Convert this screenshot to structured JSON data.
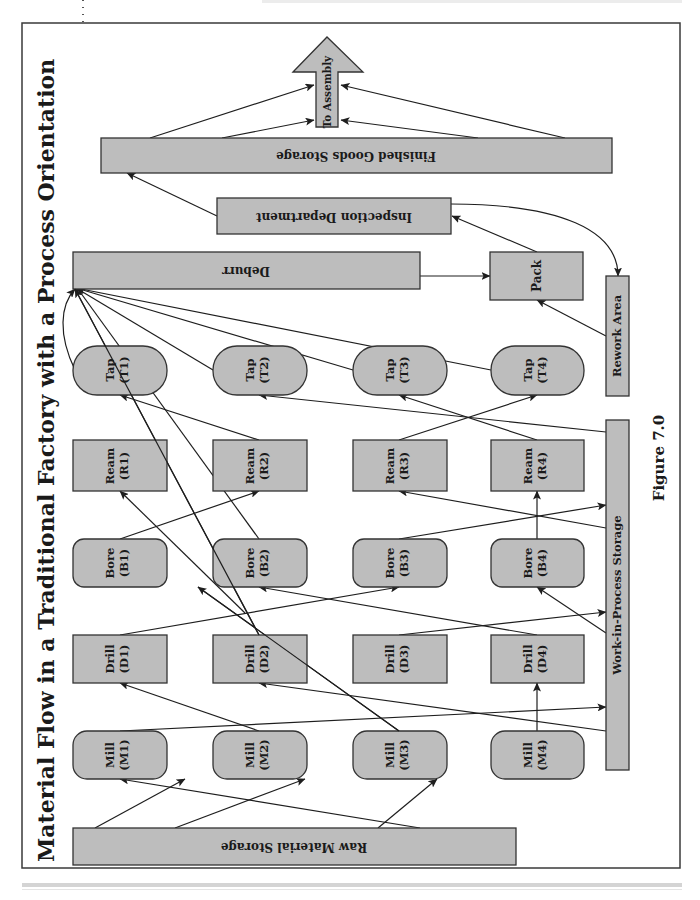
{
  "title": "Material Flow in a Traditional Factory with a Process Orientation",
  "figure_label": "Figure 7.0",
  "colors": {
    "node_fill": "#bdbdbd",
    "node_stroke": "#333333",
    "edge": "#1e1e1e",
    "background": "#ffffff"
  },
  "storage": {
    "raw_material": "Raw Material Storage",
    "work_in_process": "Work-in-Process Storage",
    "finished_goods": "Finished Goods Storage",
    "to_assembly": "To Assembly"
  },
  "departments": {
    "deburr": "Deburr",
    "pack": "Pack",
    "inspection": "Inspection Department",
    "rework": "Rework Area"
  },
  "machines": {
    "mill": [
      {
        "name": "Mill",
        "id": "(M1)"
      },
      {
        "name": "Mill",
        "id": "(M2)"
      },
      {
        "name": "Mill",
        "id": "(M3)"
      },
      {
        "name": "Mill",
        "id": "(M4)"
      }
    ],
    "drill": [
      {
        "name": "Drill",
        "id": "(D1)"
      },
      {
        "name": "Drill",
        "id": "(D2)"
      },
      {
        "name": "Drill",
        "id": "(D3)"
      },
      {
        "name": "Drill",
        "id": "(D4)"
      }
    ],
    "bore": [
      {
        "name": "Bore",
        "id": "(B1)"
      },
      {
        "name": "Bore",
        "id": "(B2)"
      },
      {
        "name": "Bore",
        "id": "(B3)"
      },
      {
        "name": "Bore",
        "id": "(B4)"
      }
    ],
    "ream": [
      {
        "name": "Ream",
        "id": "(R1)"
      },
      {
        "name": "Ream",
        "id": "(R2)"
      },
      {
        "name": "Ream",
        "id": "(R3)"
      },
      {
        "name": "Ream",
        "id": "(R4)"
      }
    ],
    "tap": [
      {
        "name": "Tap",
        "id": "(T1)"
      },
      {
        "name": "Tap",
        "id": "(T2)"
      },
      {
        "name": "Tap",
        "id": "(T3)"
      },
      {
        "name": "Tap",
        "id": "(T4)"
      }
    ]
  },
  "flows": [
    [
      "Raw Material Storage",
      "M1"
    ],
    [
      "Raw Material Storage",
      "M2"
    ],
    [
      "Raw Material Storage",
      "M3"
    ],
    [
      "Raw Material Storage",
      "M4"
    ],
    [
      "M1",
      "Work-in-Process Storage"
    ],
    [
      "M2",
      "D1"
    ],
    [
      "M3",
      "B2"
    ],
    [
      "M4",
      "D4"
    ],
    [
      "Work-in-Process Storage",
      "D2"
    ],
    [
      "D1",
      "B3"
    ],
    [
      "D2",
      "T1"
    ],
    [
      "D3",
      "Work-in-Process Storage"
    ],
    [
      "D4",
      "B2"
    ],
    [
      "Work-in-Process Storage",
      "B4"
    ],
    [
      "B1",
      "R2"
    ],
    [
      "B2",
      "R1"
    ],
    [
      "B3",
      "Work-in-Process Storage"
    ],
    [
      "B4",
      "R4"
    ],
    [
      "Work-in-Process Storage",
      "R3"
    ],
    [
      "R2",
      "T1"
    ],
    [
      "R3",
      "T4"
    ],
    [
      "R4",
      "T3"
    ],
    [
      "Work-in-Process Storage",
      "T2"
    ],
    [
      "T1",
      "Deburr"
    ],
    [
      "T2",
      "Deburr"
    ],
    [
      "T3",
      "Deburr"
    ],
    [
      "T4",
      "Deburr"
    ],
    [
      "Deburr",
      "Pack"
    ],
    [
      "Rework Area",
      "Pack"
    ],
    [
      "Pack",
      "Inspection Department"
    ],
    [
      "Inspection Department",
      "Rework Area"
    ],
    [
      "Inspection Department",
      "Finished Goods Storage"
    ],
    [
      "Finished Goods Storage",
      "To Assembly"
    ]
  ]
}
